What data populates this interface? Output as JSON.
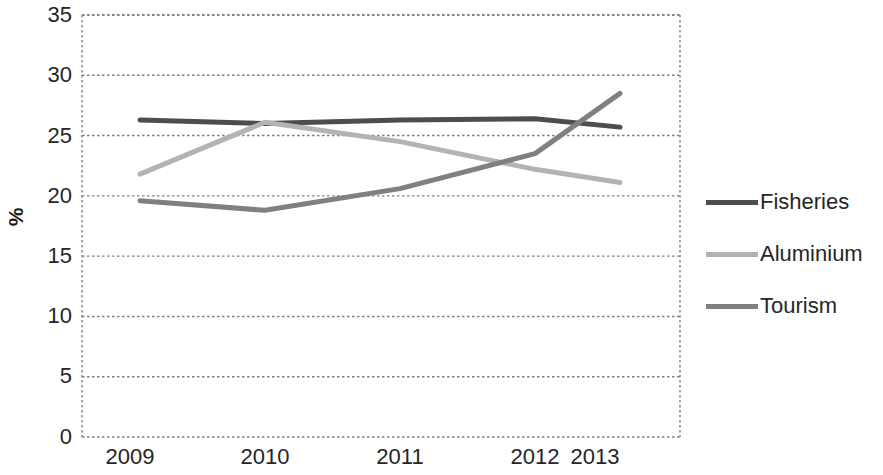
{
  "chart_data": {
    "type": "line",
    "title": "",
    "xlabel": "",
    "ylabel": "%",
    "categories": [
      "2009",
      "2010",
      "2011",
      "2012",
      "2013"
    ],
    "x": [
      2009,
      2010,
      2011,
      2012,
      2013
    ],
    "series": [
      {
        "name": "Fisheries",
        "values": [
          26.3,
          26.0,
          26.3,
          26.4,
          25.7
        ],
        "color": "#4d4d4d"
      },
      {
        "name": "Aluminium",
        "values": [
          21.8,
          26.1,
          24.5,
          22.2,
          21.1
        ],
        "color": "#b3b3b3"
      },
      {
        "name": "Tourism",
        "values": [
          19.6,
          18.8,
          20.6,
          23.5,
          28.5
        ],
        "color": "#808080"
      }
    ],
    "ylim": [
      0,
      35
    ],
    "ytick_values": [
      0,
      5,
      10,
      15,
      20,
      25,
      30,
      35
    ],
    "ytick_labels": [
      "0",
      "5",
      "10",
      "15",
      "20",
      "25",
      "30",
      "35"
    ],
    "xtick_labels": [
      "2009",
      "2010",
      "2011",
      "2012",
      "2013"
    ],
    "grid": true,
    "grid_axis": "y",
    "grid_style": "dotted",
    "grid_color": "#808080",
    "legend_position": "right",
    "plot_background": "#ffffff",
    "axis_color": "#808080"
  },
  "axis": {
    "y_label": "%",
    "y_ticks": [
      "35",
      "30",
      "25",
      "20",
      "15",
      "10",
      "5",
      "0"
    ],
    "x_ticks": [
      "2009",
      "2010",
      "2011",
      "2012",
      "2013"
    ]
  },
  "legend": {
    "items": [
      {
        "label": "Fisheries",
        "color": "#4d4d4d"
      },
      {
        "label": "Aluminium",
        "color": "#b3b3b3"
      },
      {
        "label": "Tourism",
        "color": "#808080"
      }
    ]
  }
}
